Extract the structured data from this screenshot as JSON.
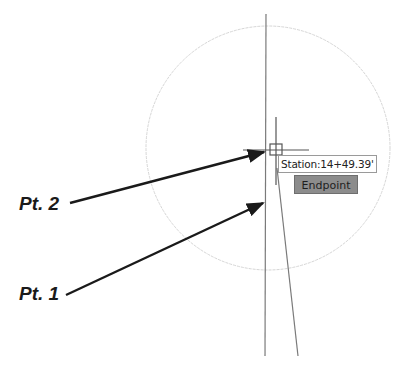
{
  "labels": {
    "pt2": "Pt. 2",
    "pt1": "Pt. 1"
  },
  "tooltip": {
    "station_text": "Station:14+49.39'"
  },
  "osnap": {
    "label": "Endpoint"
  },
  "colors": {
    "arrow": "#1a1a1a",
    "circle": "#d4d4d4",
    "line": "#7a7a7a",
    "snap_fill": "#8c8c8c"
  }
}
